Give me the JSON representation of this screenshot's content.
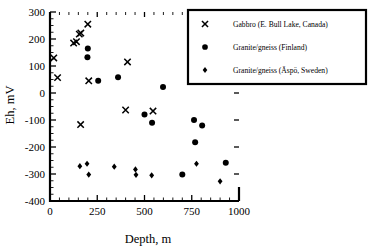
{
  "chart_data": {
    "type": "scatter",
    "title": "",
    "xlabel": "Depth, m",
    "ylabel": "Eh, mV",
    "xlim": [
      0,
      1000
    ],
    "ylim": [
      -400,
      300
    ],
    "xticks": [
      0,
      250,
      500,
      750,
      1000
    ],
    "yticks": [
      300,
      200,
      100,
      0,
      -100,
      -200,
      -300,
      -400
    ],
    "xticklabels": [
      "0",
      "250",
      "500",
      "750",
      "1000"
    ],
    "yticklabels": [
      "300",
      "200",
      "100",
      "0",
      "-100",
      "-200",
      "-300",
      "-400"
    ],
    "xminor_step": 50,
    "yminor_step": 25,
    "grid": false,
    "legend_position": "upper right",
    "series": [
      {
        "name": "Gabbro (E. Bull Lake, Canada)",
        "marker": "x",
        "points": [
          {
            "x": 20,
            "y": 130
          },
          {
            "x": 40,
            "y": 57
          },
          {
            "x": 125,
            "y": 185
          },
          {
            "x": 140,
            "y": 190
          },
          {
            "x": 155,
            "y": 218
          },
          {
            "x": 163,
            "y": 222
          },
          {
            "x": 162,
            "y": -117
          },
          {
            "x": 200,
            "y": 255
          },
          {
            "x": 205,
            "y": 45
          },
          {
            "x": 410,
            "y": 115
          },
          {
            "x": 400,
            "y": -63
          },
          {
            "x": 545,
            "y": -67
          }
        ]
      },
      {
        "name": "Granite/gneiss (Finland)",
        "marker": "circle",
        "points": [
          {
            "x": 200,
            "y": 165
          },
          {
            "x": 198,
            "y": 132
          },
          {
            "x": 255,
            "y": 45
          },
          {
            "x": 360,
            "y": 58
          },
          {
            "x": 500,
            "y": -80
          },
          {
            "x": 540,
            "y": -110
          },
          {
            "x": 598,
            "y": 22
          },
          {
            "x": 700,
            "y": -302
          },
          {
            "x": 762,
            "y": -100
          },
          {
            "x": 768,
            "y": -182
          },
          {
            "x": 805,
            "y": -120
          },
          {
            "x": 930,
            "y": -258
          }
        ]
      },
      {
        "name": "Granite/gneiss (Äspö, Sweden)",
        "marker": "diamond",
        "points": [
          {
            "x": 158,
            "y": -271
          },
          {
            "x": 196,
            "y": -262
          },
          {
            "x": 205,
            "y": -302
          },
          {
            "x": 340,
            "y": -273
          },
          {
            "x": 452,
            "y": -283
          },
          {
            "x": 455,
            "y": -303
          },
          {
            "x": 538,
            "y": -305
          },
          {
            "x": 775,
            "y": -262
          },
          {
            "x": 900,
            "y": -327
          }
        ]
      }
    ]
  },
  "legend": {
    "entries": [
      {
        "label": "Gabbro (E. Bull Lake, Canada)",
        "marker": "x"
      },
      {
        "label": "Granite/gneiss (Finland)",
        "marker": "circle"
      },
      {
        "label": "Granite/gneiss (Äspö, Sweden)",
        "marker": "diamond"
      }
    ]
  },
  "colors": {
    "foreground": "#000000",
    "background": "#ffffff"
  }
}
